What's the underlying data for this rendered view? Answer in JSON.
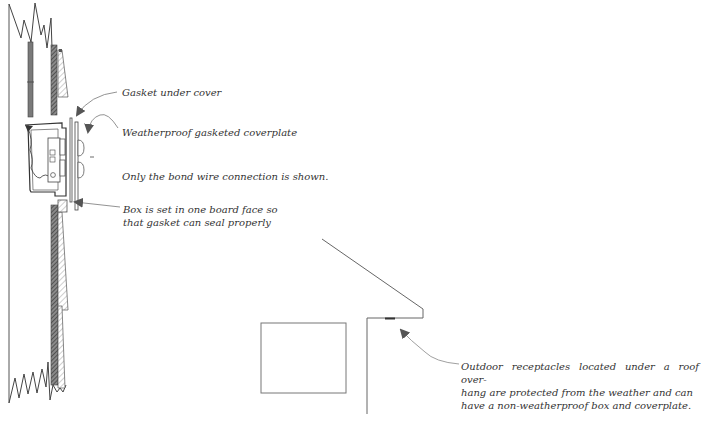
{
  "diagram": {
    "labels": {
      "gasket": "Gasket under cover",
      "coverplate": "Weatherproof gasketed coverplate",
      "bond_wire": "Only the bond wire connection is shown.",
      "box_line1": "Box is set in one board face so",
      "box_line2": "that gasket can seal properly",
      "overhang_line1": "Outdoor receptacles located under a roof  over-",
      "overhang_line2": "hang are protected from the weather and can",
      "overhang_line3": "have a non-weatherproof  box and coverplate."
    },
    "colors": {
      "line": "#555555",
      "hatch_dark": "#666666",
      "arrow": "#555555",
      "text": "#333333",
      "background": "#ffffff"
    }
  }
}
